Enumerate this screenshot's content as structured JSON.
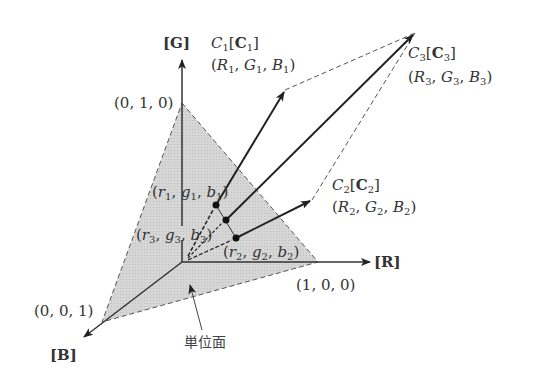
{
  "diagram": {
    "type": "rgb-color-space-vector-diagram",
    "axes": {
      "g_label": "[G]",
      "r_label": "[R]",
      "b_label": "[B]"
    },
    "vertices": {
      "g_unit": "(0, 1, 0)",
      "r_unit": "(1, 0, 0)",
      "b_unit": "(0, 0, 1)"
    },
    "colors": [
      {
        "name": "C1",
        "label": "C1[C1]",
        "tristimulus": "(R1, G1, B1)",
        "chromaticity": "(r1, g1, b1)"
      },
      {
        "name": "C2",
        "label": "C2[C2]",
        "tristimulus": "(R2, G2, B2)",
        "chromaticity": "(r2, g2, b2)"
      },
      {
        "name": "C3",
        "label": "C3[C3]",
        "tristimulus": "(R3, G3, B3)",
        "chromaticity": "(r3, g3, b3)"
      }
    ],
    "unit_plane_label": "単位面",
    "style": {
      "plane_fill": "#d4d4d4",
      "line_color": "#222222",
      "dash_color": "#555555"
    }
  }
}
